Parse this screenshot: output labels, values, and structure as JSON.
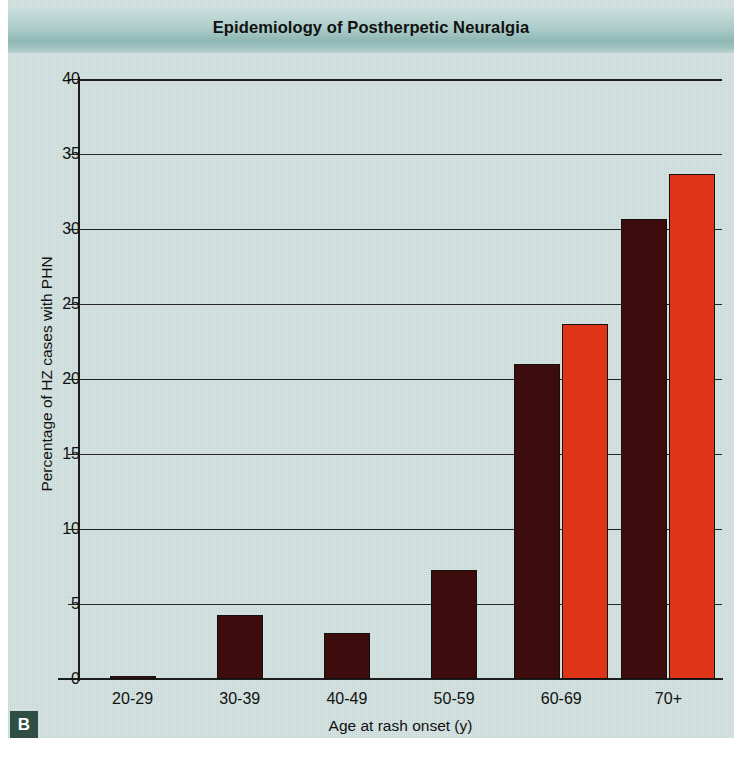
{
  "figure": {
    "title": "Epidemiology of Postherpetic Neuralgia",
    "panel_label": "B",
    "background_color": "#cfe0de",
    "title_band_color": "#a8c9c6",
    "panel_label_color": "#2f4f45"
  },
  "chart_data": {
    "type": "bar",
    "title": "Epidemiology of Postherpetic Neuralgia",
    "xlabel": "Age at rash onset (y)",
    "ylabel": "Percentage of HZ cases with PHN",
    "categories": [
      "20-29",
      "30-39",
      "40-49",
      "50-59",
      "60-69",
      "70+"
    ],
    "series": [
      {
        "name": "series-1",
        "color": "#3d0d0d",
        "values": [
          0.2,
          4.3,
          3.1,
          7.3,
          21.0,
          30.7
        ]
      },
      {
        "name": "series-2",
        "color": "#e03419",
        "values": [
          null,
          null,
          null,
          null,
          23.7,
          33.7
        ]
      }
    ],
    "ylim": [
      0,
      40
    ],
    "yticks": [
      0,
      5,
      10,
      15,
      20,
      25,
      30,
      35,
      40
    ],
    "ytick_labels": [
      "0",
      "5",
      "10",
      "15",
      "20",
      "25",
      "30",
      "35",
      "40"
    ],
    "grid": true,
    "grid_axis": "y",
    "legend": false
  }
}
